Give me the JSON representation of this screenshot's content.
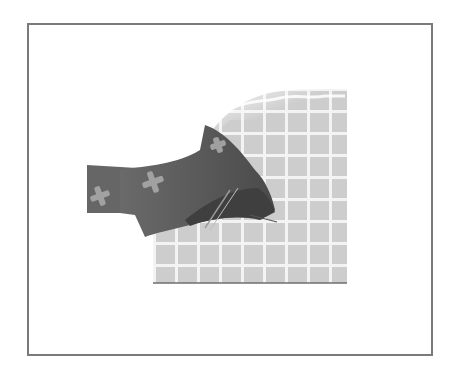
{
  "figure": {
    "alt": "Illustration: dark fabric strip with light cross pattern folded over a light grid-patterned fabric square",
    "colors": {
      "frame_border": "#7a7a7a",
      "background": "#ffffff",
      "grid_fabric": "#cfcfcf",
      "grid_lines": "#f4f4f4",
      "dark_fabric": "#5c5c5c",
      "dark_fabric_shadow": "#3e3e3e",
      "cross_motif": "#a9a9a9"
    }
  }
}
